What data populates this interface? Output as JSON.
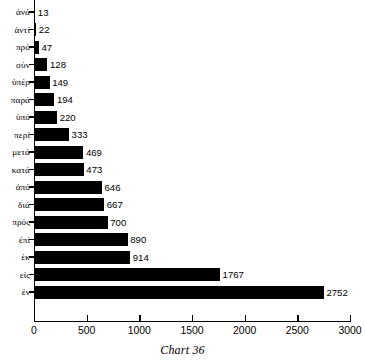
{
  "chart_data": {
    "type": "bar",
    "orientation": "horizontal",
    "title": "",
    "caption": "Chart 36",
    "xlabel": "",
    "ylabel": "",
    "xlim": [
      0,
      3000
    ],
    "grid": false,
    "legend": null,
    "bar_color": "#000000",
    "axis_color": "#000000",
    "background": "#ffffff",
    "xticks": [
      0,
      500,
      1000,
      1500,
      2000,
      2500,
      3000
    ],
    "xtick_labels": [
      "0",
      "500",
      "1000",
      "1500",
      "2000",
      "2500",
      "3000"
    ],
    "categories": [
      "ἀνά",
      "ἀντί",
      "πρό",
      "σύν",
      "ὑπέρ",
      "παρά",
      "ὑπό",
      "περί",
      "μετά",
      "κατά",
      "ἀπό",
      "διά",
      "πρός",
      "ἐπί",
      "ἐκ",
      "εἰς",
      "ἐν"
    ],
    "values": [
      13,
      22,
      47,
      128,
      149,
      194,
      220,
      333,
      469,
      473,
      646,
      667,
      700,
      890,
      914,
      1767,
      2752
    ],
    "value_labels": [
      "13",
      "22",
      "47",
      "128",
      "149",
      "194",
      "220",
      "333",
      "469",
      "473",
      "646",
      "667",
      "700",
      "890",
      "914",
      "1767",
      "2752"
    ]
  }
}
